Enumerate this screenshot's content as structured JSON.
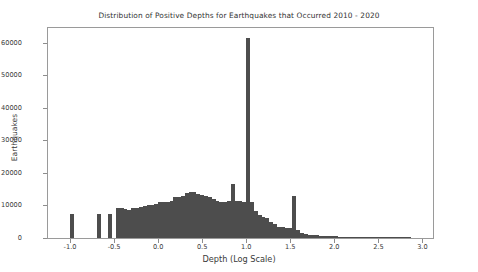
{
  "chart_data": {
    "type": "bar",
    "title": "Distribution of Positive Depths for Earthquakes that Occurred 2010 - 2020",
    "xlabel": "Depth (Log Scale)",
    "ylabel": "Earthquakes",
    "xlim": [
      -1.25,
      3.12
    ],
    "ylim": [
      0,
      64500
    ],
    "grid": false,
    "legend": null,
    "bar_color": "#4d4d4d",
    "xticks": [
      -1.0,
      -0.5,
      0.0,
      0.5,
      1.0,
      1.5,
      2.0,
      2.5,
      3.0
    ],
    "xtick_labels": [
      "-1.0",
      "-0.5",
      "0.0",
      "0.5",
      "1.0",
      "1.5",
      "2.0",
      "2.5",
      "3.0"
    ],
    "yticks": [
      0,
      10000,
      20000,
      30000,
      40000,
      50000,
      60000
    ],
    "ytick_labels": [
      "0",
      "10000",
      "20000",
      "30000",
      "40000",
      "50000",
      "60000"
    ],
    "bin_width": 0.0435,
    "bins": [
      {
        "x": -1.0435,
        "value": 0
      },
      {
        "x": -1.0,
        "value": 7400
      },
      {
        "x": -0.9565,
        "value": 0
      },
      {
        "x": -0.913,
        "value": 0
      },
      {
        "x": -0.8696,
        "value": 0
      },
      {
        "x": -0.8261,
        "value": 0
      },
      {
        "x": -0.7826,
        "value": 0
      },
      {
        "x": -0.7391,
        "value": 0
      },
      {
        "x": -0.6957,
        "value": 7400
      },
      {
        "x": -0.6522,
        "value": 0
      },
      {
        "x": -0.6087,
        "value": 0
      },
      {
        "x": -0.5652,
        "value": 7500
      },
      {
        "x": -0.5217,
        "value": 0
      },
      {
        "x": -0.4783,
        "value": 9100
      },
      {
        "x": -0.4348,
        "value": 9100
      },
      {
        "x": -0.3913,
        "value": 9000
      },
      {
        "x": -0.3478,
        "value": 8700
      },
      {
        "x": -0.3043,
        "value": 9200
      },
      {
        "x": -0.2609,
        "value": 9300
      },
      {
        "x": -0.2174,
        "value": 9500
      },
      {
        "x": -0.1739,
        "value": 9900
      },
      {
        "x": -0.1304,
        "value": 10100
      },
      {
        "x": -0.087,
        "value": 10200
      },
      {
        "x": -0.0435,
        "value": 10400
      },
      {
        "x": 0.0,
        "value": 11000
      },
      {
        "x": 0.0435,
        "value": 11200
      },
      {
        "x": 0.087,
        "value": 11100
      },
      {
        "x": 0.1304,
        "value": 11400
      },
      {
        "x": 0.1739,
        "value": 12700
      },
      {
        "x": 0.2174,
        "value": 12600
      },
      {
        "x": 0.2609,
        "value": 12800
      },
      {
        "x": 0.3043,
        "value": 13900
      },
      {
        "x": 0.3478,
        "value": 14000
      },
      {
        "x": 0.3913,
        "value": 14100
      },
      {
        "x": 0.4348,
        "value": 13400
      },
      {
        "x": 0.4783,
        "value": 13300
      },
      {
        "x": 0.5217,
        "value": 13000
      },
      {
        "x": 0.5652,
        "value": 12500
      },
      {
        "x": 0.6087,
        "value": 11900
      },
      {
        "x": 0.6522,
        "value": 11500
      },
      {
        "x": 0.6957,
        "value": 11200
      },
      {
        "x": 0.7391,
        "value": 11000
      },
      {
        "x": 0.7826,
        "value": 11300
      },
      {
        "x": 0.8261,
        "value": 16500
      },
      {
        "x": 0.8696,
        "value": 11400
      },
      {
        "x": 0.913,
        "value": 11300
      },
      {
        "x": 0.9565,
        "value": 11200
      },
      {
        "x": 1.0,
        "value": 61500
      },
      {
        "x": 1.0435,
        "value": 11000
      },
      {
        "x": 1.087,
        "value": 8200
      },
      {
        "x": 1.1304,
        "value": 7000
      },
      {
        "x": 1.1739,
        "value": 6600
      },
      {
        "x": 1.2174,
        "value": 6200
      },
      {
        "x": 1.2609,
        "value": 4900
      },
      {
        "x": 1.3043,
        "value": 4400
      },
      {
        "x": 1.3478,
        "value": 3500
      },
      {
        "x": 1.3913,
        "value": 3300
      },
      {
        "x": 1.4348,
        "value": 3100
      },
      {
        "x": 1.4783,
        "value": 3000
      },
      {
        "x": 1.5217,
        "value": 13000
      },
      {
        "x": 1.5652,
        "value": 2500
      },
      {
        "x": 1.6087,
        "value": 1500
      },
      {
        "x": 1.6522,
        "value": 1200
      },
      {
        "x": 1.6957,
        "value": 1000
      },
      {
        "x": 1.7391,
        "value": 900
      },
      {
        "x": 1.7826,
        "value": 800
      },
      {
        "x": 1.8261,
        "value": 700
      },
      {
        "x": 1.8696,
        "value": 650
      },
      {
        "x": 1.913,
        "value": 600
      },
      {
        "x": 1.9565,
        "value": 550
      },
      {
        "x": 2.0,
        "value": 500
      },
      {
        "x": 2.0435,
        "value": 450
      },
      {
        "x": 2.087,
        "value": 400
      },
      {
        "x": 2.1304,
        "value": 360
      },
      {
        "x": 2.1739,
        "value": 320
      },
      {
        "x": 2.2174,
        "value": 280
      },
      {
        "x": 2.2609,
        "value": 250
      },
      {
        "x": 2.3043,
        "value": 200
      },
      {
        "x": 2.3478,
        "value": 160
      },
      {
        "x": 2.3913,
        "value": 130
      },
      {
        "x": 2.4348,
        "value": 100
      },
      {
        "x": 2.4783,
        "value": 80
      },
      {
        "x": 2.5217,
        "value": 60
      },
      {
        "x": 2.5652,
        "value": 40
      },
      {
        "x": 2.6087,
        "value": 25
      },
      {
        "x": 2.6522,
        "value": 15
      },
      {
        "x": 2.6957,
        "value": 10
      },
      {
        "x": 2.7391,
        "value": 6
      },
      {
        "x": 2.7826,
        "value": 4
      },
      {
        "x": 2.8261,
        "value": 2
      },
      {
        "x": 2.8696,
        "value": 0
      },
      {
        "x": 2.913,
        "value": 0
      },
      {
        "x": 2.9565,
        "value": 0
      },
      {
        "x": 3.0,
        "value": 0
      }
    ]
  }
}
